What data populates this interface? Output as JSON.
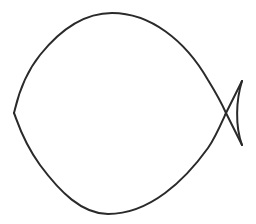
{
  "figure": {
    "style": "line drawing",
    "stroke_color": "#2a2a2a",
    "background_color": "#ffffff"
  }
}
